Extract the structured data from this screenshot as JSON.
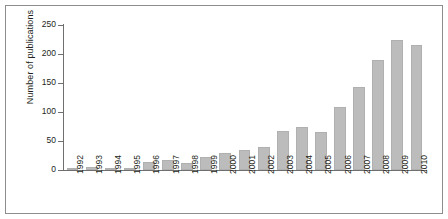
{
  "chart_data": {
    "type": "bar",
    "title": "",
    "xlabel": "",
    "ylabel": "Number of publications",
    "categories": [
      "1992",
      "1993",
      "1994",
      "1995",
      "1996",
      "1997",
      "1998",
      "1999",
      "2000",
      "2001",
      "2002",
      "2003",
      "2004",
      "2005",
      "2006",
      "2007",
      "2008",
      "2009",
      "2010"
    ],
    "values": [
      2,
      6,
      2,
      2,
      14,
      18,
      12,
      22,
      30,
      34,
      40,
      68,
      74,
      66,
      108,
      143,
      190,
      224,
      215
    ],
    "ylim": [
      0,
      250
    ],
    "yticks": [
      0,
      50,
      100,
      150,
      200,
      250
    ],
    "ytick_labels": [
      "0",
      "50",
      "100",
      "150",
      "200",
      "250"
    ],
    "grid": false,
    "legend": "none",
    "bar_color": "#bcbcbc",
    "bar_edge_color": "#b0b0b0",
    "axis_color": "#6f6f6f",
    "frame_color": "#8d8d8d",
    "text_color": "#231f20"
  }
}
